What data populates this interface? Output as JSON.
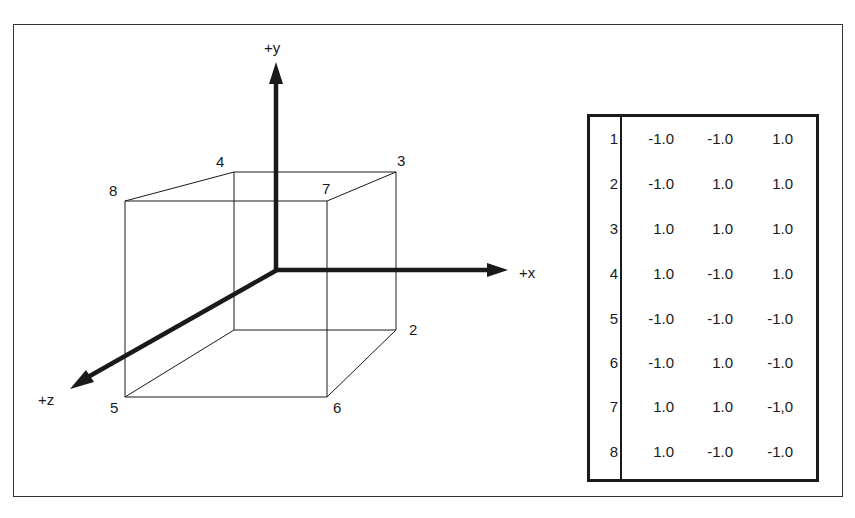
{
  "diagram": {
    "title": "",
    "axes": {
      "y_label": "+y",
      "x_label": "+x",
      "z_label": "+z"
    },
    "cube_vertex_labels": [
      "1",
      "2",
      "3",
      "4",
      "5",
      "6",
      "7",
      "8"
    ],
    "visible_vertex_labels": {
      "v2": "2",
      "v3": "3",
      "v4": "4",
      "v5": "5",
      "v6": "6",
      "v7": "7",
      "v8": "8"
    }
  },
  "vertex_table": {
    "rows": [
      {
        "index": "1",
        "x": "-1.0",
        "y": "-1.0",
        "z": "1.0"
      },
      {
        "index": "2",
        "x": "-1.0",
        "y": "1.0",
        "z": "1.0"
      },
      {
        "index": "3",
        "x": "1.0",
        "y": "1.0",
        "z": "1.0"
      },
      {
        "index": "4",
        "x": "1.0",
        "y": "-1.0",
        "z": "1.0"
      },
      {
        "index": "5",
        "x": "-1.0",
        "y": "-1.0",
        "z": "-1.0"
      },
      {
        "index": "6",
        "x": "-1.0",
        "y": "1.0",
        "z": "-1.0"
      },
      {
        "index": "7",
        "x": "1.0",
        "y": "1.0",
        "z": "-1,0"
      },
      {
        "index": "8",
        "x": "1.0",
        "y": "-1.0",
        "z": "-1.0"
      }
    ]
  },
  "colors": {
    "line": "#1a1a1a",
    "background": "#ffffff"
  }
}
